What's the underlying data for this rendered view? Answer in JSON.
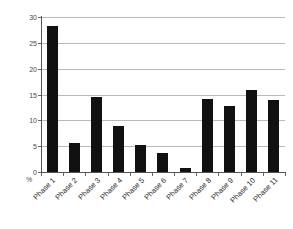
{
  "chart_data": {
    "type": "bar",
    "title": "",
    "subtitle": "",
    "xlabel": "",
    "ylabel": "%",
    "unit_label": "%",
    "categories": [
      "Phase 1",
      "Phase 2",
      "Phase 3",
      "Phase 4",
      "Phase 5",
      "Phase 6",
      "Phase 7",
      "Phase 8",
      "Phase 9",
      "Phase 10",
      "Phase 11"
    ],
    "values": [
      28.3,
      5.6,
      14.5,
      8.9,
      5.2,
      3.7,
      0.8,
      14.1,
      12.8,
      15.8,
      14.0
    ],
    "ylim": [
      0,
      30
    ],
    "yticks": [
      0,
      5,
      10,
      15,
      20,
      25,
      30
    ],
    "ytick_labels": [
      "0",
      "5",
      "10",
      "15",
      "20",
      "25",
      "30"
    ],
    "grid": true,
    "grid_axis": "y",
    "legend": false,
    "legend_position": "none",
    "bar_color": "#111111",
    "grid_color": "#b9b9b9",
    "axis_color": "#555555",
    "background_color": "#ffffff",
    "text_color": "#2b2b2b",
    "xlabel_rotation": -45
  }
}
